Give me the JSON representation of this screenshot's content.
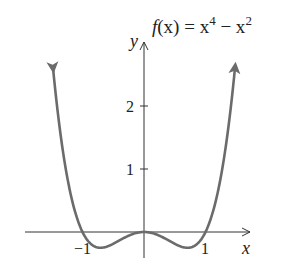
{
  "chart_data": {
    "type": "line",
    "function": "x^4 - x^2",
    "xlabel": "x",
    "ylabel": "y",
    "x_ticks": [
      -1,
      1
    ],
    "y_ticks": [
      1,
      2
    ],
    "xlim": [
      -1.45,
      1.45
    ],
    "ylim": [
      -0.5,
      3
    ],
    "grid": false,
    "series": [
      {
        "name": "f(x)",
        "x": [
          -1.3,
          -1,
          -0.707,
          0,
          0.707,
          1,
          1.3
        ],
        "values": [
          1.166,
          0,
          -0.25,
          0,
          -0.25,
          0,
          1.166
        ]
      }
    ],
    "curve_color": "#6b6b6b",
    "axis_color": "#333333"
  },
  "labels": {
    "title_f": "f",
    "title_rest": "(x) = x",
    "exp4": "4",
    "minus": " − x",
    "exp2": "2",
    "x_axis": "x",
    "y_axis": "y",
    "tick_neg1": "−1",
    "tick_1": "1",
    "tick_y1": "1",
    "tick_y2": "2"
  }
}
